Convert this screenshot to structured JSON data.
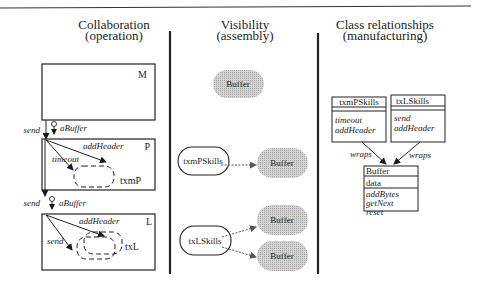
{
  "figure": {
    "panels": [
      {
        "id": "collaboration",
        "title": "Collaboration",
        "subtitle": "(operation)",
        "boxes": [
          {
            "label": "M"
          },
          {
            "label": "P",
            "inner_label": "txmP",
            "messages": [
              "addHeader",
              "timeout"
            ]
          },
          {
            "label": "L",
            "inner_label": "txL",
            "messages": [
              "addHeader",
              "send"
            ]
          }
        ],
        "flows": [
          {
            "message": "send",
            "param": "aBuffer"
          },
          {
            "message": "send",
            "param": "aBuffer"
          }
        ]
      },
      {
        "id": "visibility",
        "title": "Visibility",
        "subtitle": "(assembly)",
        "nodes": {
          "buffer_top": "Buffer",
          "txmPSkills": "txmPSkills",
          "buffer_p": "Buffer",
          "txLSkills": "txLSkills",
          "buffer_l1": "Buffer",
          "buffer_l2": "Buffer"
        }
      },
      {
        "id": "class-relationships",
        "title": "Class relationships",
        "subtitle": "(manufacturing)",
        "classes": [
          {
            "name": "txmPSkills",
            "attributes": [],
            "operations": [
              "timeout",
              "addHeader"
            ]
          },
          {
            "name": "txLSkills",
            "attributes": [],
            "operations": [
              "send",
              "addHeader"
            ]
          },
          {
            "name": "Buffer",
            "attributes": [
              "data"
            ],
            "operations": [
              "addBytes",
              "getNext",
              "reset"
            ]
          }
        ],
        "relations": [
          {
            "label": "wraps"
          },
          {
            "label": "wraps"
          }
        ]
      }
    ],
    "colors": {
      "line": "#1a1a1a",
      "shaded_fill": "#c8c8c8"
    }
  }
}
